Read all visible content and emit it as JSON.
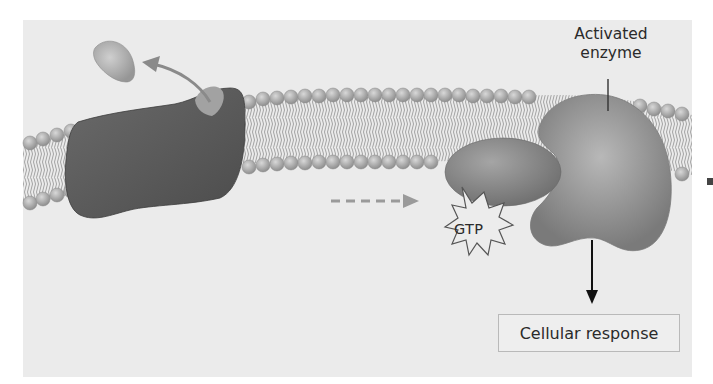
{
  "diagram": {
    "type": "G protein-coupled signaling (enzyme activation)",
    "labels": {
      "activated_enzyme": "Activated enzyme",
      "gtp": "GTP",
      "cellular_response": "Cellular response"
    },
    "elements": [
      {
        "name": "signaling-molecule",
        "description": "Ligand leaving receptor (teardrop shape)"
      },
      {
        "name": "receptor",
        "description": "Dark membrane receptor protein"
      },
      {
        "name": "plasma-membrane",
        "description": "Phospholipid bilayer"
      },
      {
        "name": "g-protein",
        "description": "G protein bound to GTP"
      },
      {
        "name": "activated-enzyme",
        "description": "Enzyme activated by G protein"
      },
      {
        "name": "dashed-arrow",
        "description": "Movement of G protein toward enzyme"
      },
      {
        "name": "response-arrow",
        "description": "Arrow from enzyme to cellular response"
      }
    ],
    "colors": {
      "background": "#ebebeb",
      "membrane_head": "#a9a9a9",
      "receptor": "#5a5a5a",
      "enzyme": "#8c8c8c",
      "g_protein": "#7e7e7e",
      "arrow": "#8a8a8a"
    }
  }
}
